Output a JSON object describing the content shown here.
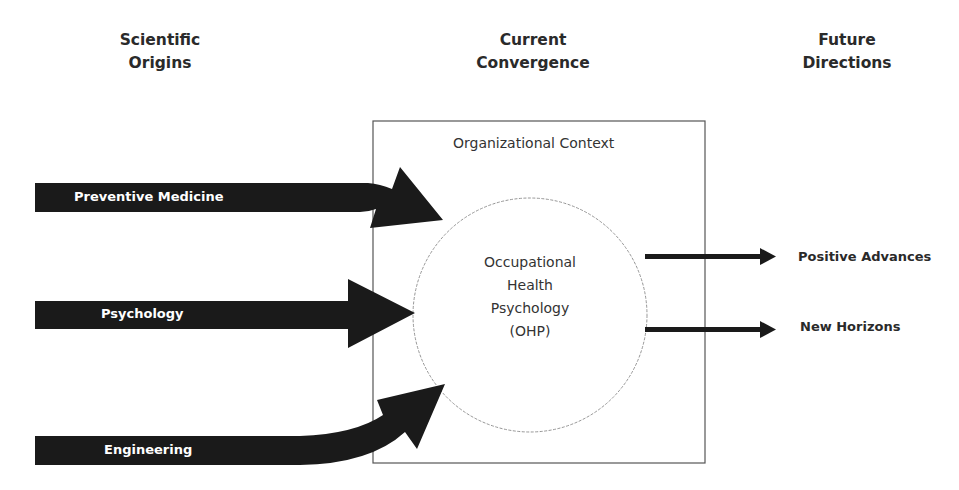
{
  "headings": {
    "origins": [
      "Scientific",
      "Origins"
    ],
    "convergence": [
      "Current",
      "Convergence"
    ],
    "future": [
      "Future",
      "Directions"
    ]
  },
  "origins": [
    {
      "label": "Preventive Medicine"
    },
    {
      "label": "Psychology"
    },
    {
      "label": "Engineering"
    }
  ],
  "context": {
    "label": "Organizational Context",
    "center": [
      "Occupational",
      "Health",
      "Psychology",
      "(OHP)"
    ]
  },
  "directions": [
    {
      "label": "Positive Advances"
    },
    {
      "label": "New Horizons"
    }
  ],
  "colors": {
    "arrow": "#1a1a1a",
    "box_border": "#555555",
    "circle_border": "#8a8a8a",
    "text": "#2a2a2a"
  }
}
